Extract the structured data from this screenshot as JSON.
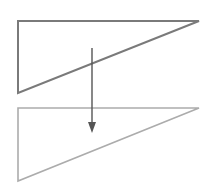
{
  "diagram": {
    "colors": {
      "background": "#ffffff",
      "source_triangle_stroke": "#7a7a7a",
      "target_triangle_stroke": "#acacac",
      "arrow": "#555555"
    },
    "shapes": [
      {
        "id": "source-triangle",
        "type": "triangle",
        "points": [
          [
            18,
            21
          ],
          [
            199,
            21
          ],
          [
            18,
            93
          ]
        ]
      },
      {
        "id": "target-triangle",
        "type": "triangle",
        "points": [
          [
            18,
            108
          ],
          [
            199,
            108
          ],
          [
            18,
            181
          ]
        ]
      }
    ],
    "arrow": {
      "from": [
        92,
        48
      ],
      "to": [
        92,
        133
      ],
      "direction": "down"
    }
  }
}
